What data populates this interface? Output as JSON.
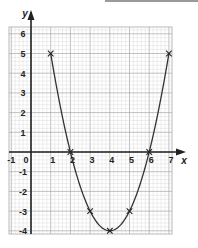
{
  "chart_data": {
    "type": "line",
    "title": "",
    "xlabel": "x",
    "ylabel": "y",
    "xlim": [
      -1,
      7
    ],
    "ylim": [
      -4,
      6
    ],
    "grid": true,
    "x_ticks": [
      "-1",
      "0",
      "1",
      "2",
      "3",
      "4",
      "5",
      "6",
      "7"
    ],
    "y_ticks": [
      "-4",
      "-3",
      "-2",
      "-1",
      "1",
      "2",
      "3",
      "4",
      "5",
      "6"
    ],
    "series": [
      {
        "name": "y = x^2 - 8x + 12",
        "x": [
          1,
          2,
          3,
          4,
          5,
          6,
          7
        ],
        "values": [
          5,
          0,
          -3,
          -4,
          -3,
          0,
          5
        ],
        "marker": "x"
      }
    ],
    "colors": {
      "grid_minor": "#d4d4d4",
      "grid_major": "#a8a8a8",
      "axis": "#222222",
      "curve": "#333333"
    }
  }
}
